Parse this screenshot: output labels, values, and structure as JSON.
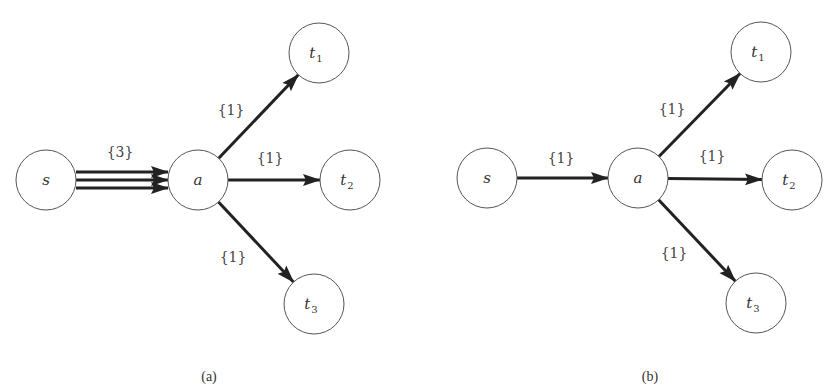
{
  "colors": {
    "edge": "#222222",
    "node_stroke": "#555555",
    "text": "#333333",
    "background": "#ffffff"
  },
  "panels": [
    {
      "id": "a",
      "caption": "(a)",
      "caption_pos": [
        209,
        381
      ],
      "nodes": [
        {
          "id": "s",
          "base": "s",
          "sub": "",
          "x": 46,
          "y": 180,
          "r": 30
        },
        {
          "id": "a",
          "base": "a",
          "sub": "",
          "x": 198,
          "y": 180,
          "r": 30
        },
        {
          "id": "t1",
          "base": "t",
          "sub": "1",
          "x": 319,
          "y": 53,
          "r": 30
        },
        {
          "id": "t2",
          "base": "t",
          "sub": "2",
          "x": 350,
          "y": 180,
          "r": 30
        },
        {
          "id": "t3",
          "base": "t",
          "sub": "3",
          "x": 314,
          "y": 304,
          "r": 30
        }
      ],
      "edges": [
        {
          "from": "s",
          "to": "a",
          "label": "{3}",
          "multiplicity": 3,
          "label_pos": [
            120,
            157
          ]
        },
        {
          "from": "a",
          "to": "t1",
          "label": "{1}",
          "multiplicity": 1,
          "label_pos": [
            231,
            115
          ]
        },
        {
          "from": "a",
          "to": "t2",
          "label": "{1}",
          "multiplicity": 1,
          "label_pos": [
            270,
            163
          ]
        },
        {
          "from": "a",
          "to": "t3",
          "label": "{1}",
          "multiplicity": 1,
          "label_pos": [
            233,
            262
          ]
        }
      ]
    },
    {
      "id": "b",
      "caption": "(b)",
      "caption_pos": [
        650,
        381
      ],
      "nodes": [
        {
          "id": "s",
          "base": "s",
          "sub": "",
          "x": 487,
          "y": 178,
          "r": 30
        },
        {
          "id": "a",
          "base": "a",
          "sub": "",
          "x": 638,
          "y": 178,
          "r": 30
        },
        {
          "id": "t1",
          "base": "t",
          "sub": "1",
          "x": 761,
          "y": 52,
          "r": 30
        },
        {
          "id": "t2",
          "base": "t",
          "sub": "2",
          "x": 792,
          "y": 180,
          "r": 30
        },
        {
          "id": "t3",
          "base": "t",
          "sub": "3",
          "x": 756,
          "y": 303,
          "r": 30
        }
      ],
      "edges": [
        {
          "from": "s",
          "to": "a",
          "label": "{1}",
          "multiplicity": 1,
          "label_pos": [
            561,
            163
          ]
        },
        {
          "from": "a",
          "to": "t1",
          "label": "{1}",
          "multiplicity": 1,
          "label_pos": [
            672,
            114
          ]
        },
        {
          "from": "a",
          "to": "t2",
          "label": "{1}",
          "multiplicity": 1,
          "label_pos": [
            712,
            161
          ]
        },
        {
          "from": "a",
          "to": "t3",
          "label": "{1}",
          "multiplicity": 1,
          "label_pos": [
            674,
            258
          ]
        }
      ]
    }
  ]
}
